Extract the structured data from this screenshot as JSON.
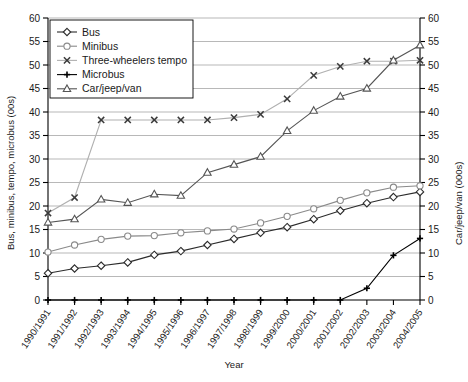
{
  "chart_data": {
    "type": "line",
    "title": "",
    "xlabel": "Year",
    "ylabel": "Bus, minibus, tempo, microbus (00s)",
    "y2label": "Car/jeep/van (000s)",
    "ylim": [
      0,
      60
    ],
    "y2lim": [
      0,
      60
    ],
    "yticks": [
      0,
      5,
      10,
      15,
      20,
      25,
      30,
      35,
      40,
      45,
      50,
      55,
      60
    ],
    "y2ticks": [
      0,
      5,
      10,
      15,
      20,
      25,
      30,
      35,
      40,
      45,
      50,
      55,
      60
    ],
    "grid": true,
    "legend_position": "top-left",
    "categories": [
      "1990/1991",
      "1991/1992",
      "1992/1993",
      "1993/1994",
      "1994/1995",
      "1995/1996",
      "1996/1997",
      "1997/1998",
      "1998/1999",
      "1999/2000",
      "2000/2001",
      "2001/2002",
      "2002/2003",
      "2003/2004",
      "2004/2005"
    ],
    "series": [
      {
        "name": "Bus",
        "marker": "diamond",
        "color": "#2b2b2b",
        "axis": "left",
        "values": [
          5.7,
          6.7,
          7.3,
          8.0,
          9.6,
          10.4,
          11.7,
          13.0,
          14.3,
          15.5,
          17.2,
          19.0,
          20.6,
          21.9,
          23.0
        ]
      },
      {
        "name": "Minibus",
        "marker": "circle",
        "color": "#8a8a8a",
        "axis": "left",
        "values": [
          10.2,
          11.7,
          12.9,
          13.6,
          13.7,
          14.3,
          14.7,
          15.1,
          16.4,
          17.8,
          19.4,
          21.2,
          22.8,
          24.0,
          24.3
        ]
      },
      {
        "name": "Three-wheelers tempo",
        "marker": "cross",
        "color": "#b0b0b0",
        "axis": "left",
        "values": [
          18.5,
          21.8,
          38.3,
          38.3,
          38.3,
          38.3,
          38.3,
          38.8,
          39.5,
          42.8,
          47.8,
          49.7,
          50.8,
          50.8,
          51.0
        ]
      },
      {
        "name": "Microbus",
        "marker": "plus",
        "color": "#000000",
        "axis": "left",
        "values": [
          0,
          0,
          0,
          0,
          0,
          0,
          0,
          0,
          0,
          0,
          0,
          0,
          2.5,
          9.5,
          13.1
        ]
      },
      {
        "name": "Car/jeep/van",
        "marker": "triangle",
        "color": "#555555",
        "axis": "right",
        "values": [
          16.5,
          17.2,
          21.4,
          20.7,
          22.5,
          22.2,
          27.1,
          28.8,
          30.5,
          36.0,
          40.3,
          43.3,
          45.0,
          51.0,
          54.2
        ]
      }
    ]
  }
}
